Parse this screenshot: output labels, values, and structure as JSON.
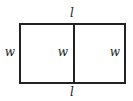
{
  "diagram": {
    "type": "rectangle divided into two equal parts",
    "labels": {
      "top": "l",
      "bottom": "l",
      "left": "w",
      "middle": "w",
      "right": "w"
    },
    "colors": {
      "stroke": "#222222",
      "background": "#ffffff"
    }
  }
}
